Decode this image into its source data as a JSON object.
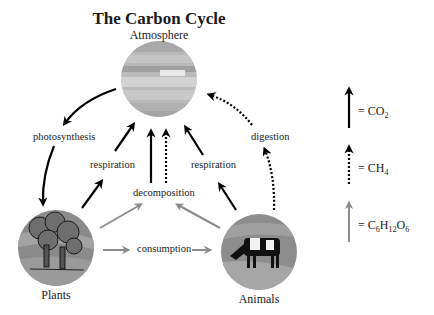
{
  "title": "The Carbon Cycle",
  "nodes": {
    "atmosphere": {
      "label": "Atmosphere"
    },
    "plants": {
      "label": "Plants"
    },
    "animals": {
      "label": "Animals"
    }
  },
  "processes": {
    "photosynthesis": "photosynthesis",
    "respiration_plants": "respiration",
    "respiration_animals": "respiration",
    "decomposition": "decomposition",
    "digestion": "digestion",
    "consumption": "consumption"
  },
  "legend": [
    {
      "style": "solid-black",
      "label_prefix": "= CO",
      "sub": "2",
      "color": "#000000"
    },
    {
      "style": "dotted-black",
      "label_prefix": "= CH",
      "sub": "4",
      "color": "#000000"
    },
    {
      "style": "solid-gray",
      "label_parts": [
        "= C",
        "6",
        "H",
        "12",
        "O",
        "6"
      ],
      "color": "#8c8c8c"
    }
  ],
  "colors": {
    "co2_arrow": "#000000",
    "ch4_arrow": "#000000",
    "glucose_arrow": "#8c8c8c"
  }
}
